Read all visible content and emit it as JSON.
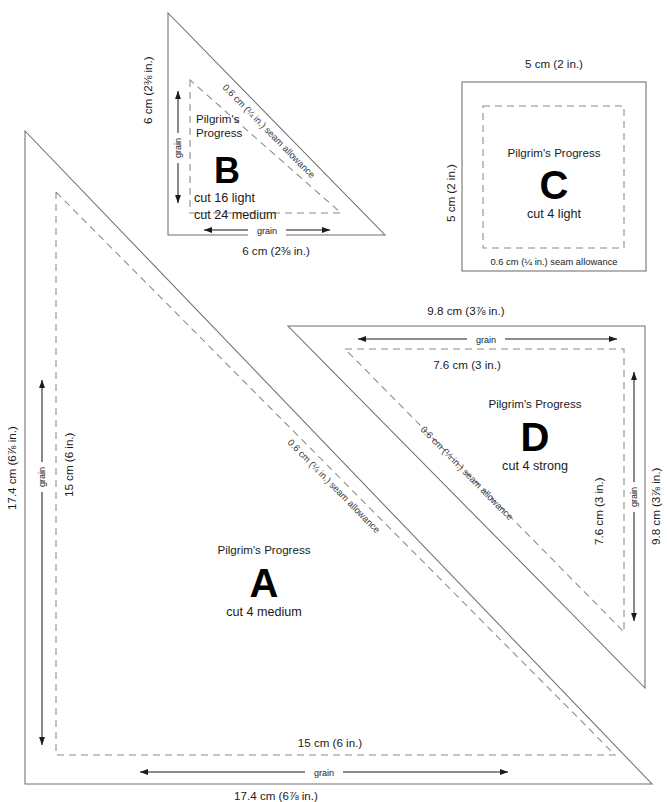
{
  "document": {
    "title": "Pilgrim's Progress quilt block templates",
    "pattern_name": "Pilgrim's Progress",
    "grain_label": "grain",
    "seam_allowance_label": "0.6 cm (¼ in.) seam allowance"
  },
  "templates": [
    {
      "id": "A",
      "letter": "A",
      "shape": "right-triangle",
      "pattern_name": "Pilgrim's Progress",
      "cut_instructions": [
        "cut 4 medium"
      ],
      "seam_allowance_label": "0.6 cm (¼ in.) seam allowance",
      "grain_label_vertical": "grain",
      "grain_label_horizontal": "grain",
      "dimensions": {
        "outer_left": "17.4 cm (6⅞ in.)",
        "inner_left": "15 cm (6 in.)",
        "inner_bottom": "15 cm (6 in.)",
        "outer_bottom": "17.4 cm (6⅞ in.)"
      }
    },
    {
      "id": "B",
      "letter": "B",
      "shape": "right-triangle",
      "pattern_name": "Pilgrim's Progress",
      "pattern_name_line1": "Pilgrim's",
      "pattern_name_line2": "Progress",
      "cut_instructions": [
        "cut 16 light",
        "cut 24 medium"
      ],
      "seam_allowance_label": "0.6 cm (¼ in.) seam allowance",
      "grain_label_vertical": "grain",
      "grain_label_horizontal": "grain",
      "dimensions": {
        "outer_left": "6 cm (2⅜ in.)",
        "outer_bottom": "6 cm (2⅜ in.)"
      }
    },
    {
      "id": "C",
      "letter": "C",
      "shape": "square",
      "pattern_name": "Pilgrim's Progress",
      "cut_instructions": [
        "cut 4 light"
      ],
      "seam_allowance_label": "0.6 cm (¼ in.) seam allowance",
      "dimensions": {
        "outer_top": "5 cm (2 in.)",
        "outer_left": "5 cm (2 in.)"
      }
    },
    {
      "id": "D",
      "letter": "D",
      "shape": "right-triangle",
      "pattern_name": "Pilgrim's Progress",
      "cut_instructions": [
        "cut 4 strong"
      ],
      "seam_allowance_label": "0.6 cm (¼ in.) seam allowance",
      "grain_label_top": "grain",
      "grain_label_right": "grain",
      "dimensions": {
        "outer_top": "9.8 cm (3⅞ in.)",
        "inner_top": "7.6 cm (3 in.)",
        "inner_right": "7.6 cm (3 in.)",
        "outer_right": "9.8 cm (3⅞ in.)"
      }
    }
  ],
  "colors": {
    "outline": "#6f6f6f",
    "seamline": "#8a8a8a",
    "text": "#1b1b1b",
    "seam_text": "#3a3a3a",
    "background": "#ffffff"
  }
}
